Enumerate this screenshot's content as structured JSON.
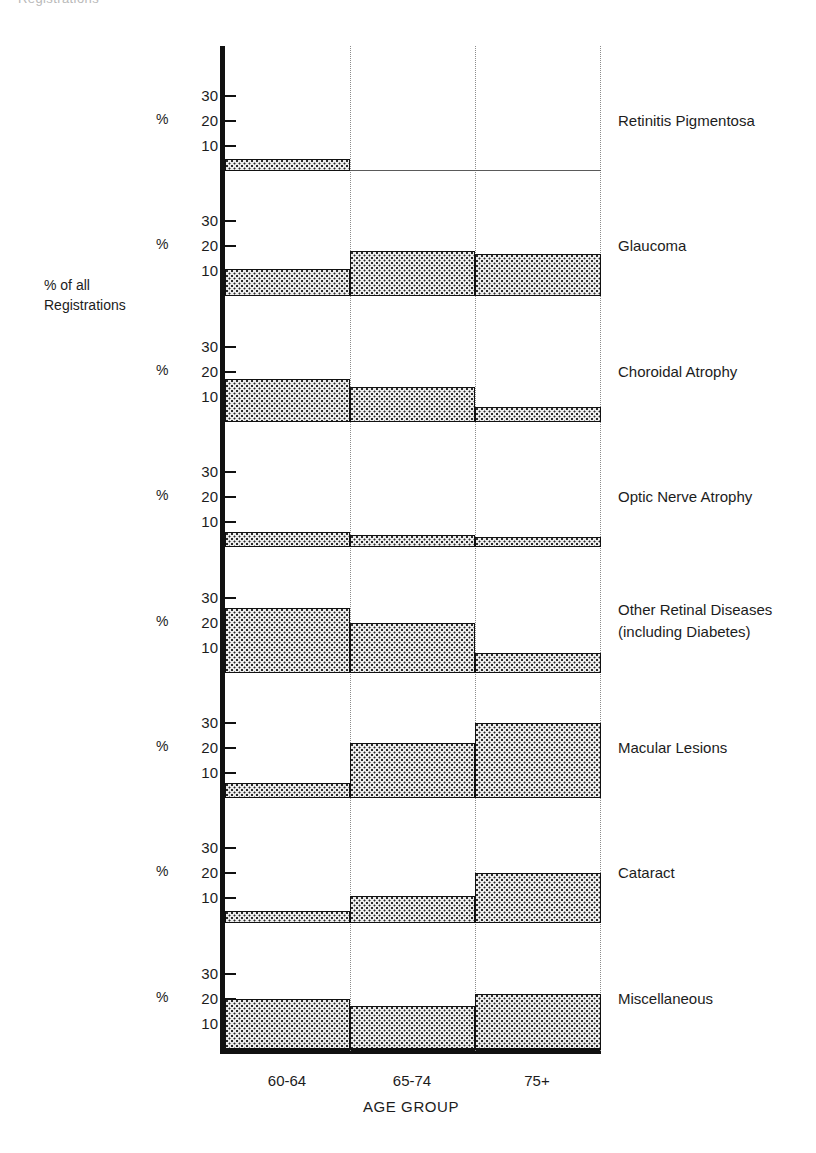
{
  "header_fragment": "Registrations",
  "axes": {
    "y_title": "% of all\nRegistrations",
    "y_title_line1": "% of all",
    "y_title_line2": "Registrations",
    "y_unit_symbol": "%",
    "y_ticks": [
      "30",
      "20",
      "10"
    ],
    "x_title": "AGE GROUP",
    "x_tick_labels": [
      "60-64",
      "65-74",
      "75+"
    ]
  },
  "chart_data": {
    "type": "bar",
    "title": "",
    "subtitle": "",
    "xlabel": "AGE GROUP",
    "ylabel": "% of all Registrations",
    "ylim": [
      0,
      38
    ],
    "yticks": [
      10,
      20,
      30
    ],
    "grid": "vertical dotted category separators",
    "legend": "none (panel labels at right)",
    "layout": "small multiples, 8 stacked panels sharing one x-axis",
    "categories": [
      "60-64",
      "65-74",
      "75+"
    ],
    "series": [
      {
        "name": "Retinitis Pigmentosa",
        "values": [
          5,
          0,
          0
        ]
      },
      {
        "name": "Glaucoma",
        "values": [
          11,
          18,
          17
        ]
      },
      {
        "name": "Choroidal Atrophy",
        "values": [
          17,
          14,
          6
        ]
      },
      {
        "name": "Optic Nerve Atrophy",
        "values": [
          6,
          5,
          4
        ]
      },
      {
        "name": "Other Retinal Diseases",
        "values": [
          26,
          20,
          8
        ]
      },
      {
        "name": "Macular Lesions",
        "values": [
          6,
          22,
          30
        ]
      },
      {
        "name": "Cataract",
        "values": [
          5,
          11,
          20
        ]
      },
      {
        "name": "Miscellaneous",
        "values": [
          20,
          17,
          22
        ]
      }
    ]
  },
  "panels": [
    {
      "label_line1": "Retinitis Pigmentosa",
      "label_line2": ""
    },
    {
      "label_line1": "Glaucoma",
      "label_line2": ""
    },
    {
      "label_line1": "Choroidal Atrophy",
      "label_line2": ""
    },
    {
      "label_line1": "Optic Nerve Atrophy",
      "label_line2": ""
    },
    {
      "label_line1": "Other Retinal Diseases",
      "label_line2": "(including Diabetes)"
    },
    {
      "label_line1": "Macular Lesions",
      "label_line2": ""
    },
    {
      "label_line1": "Cataract",
      "label_line2": ""
    },
    {
      "label_line1": "Miscellaneous",
      "label_line2": ""
    }
  ]
}
